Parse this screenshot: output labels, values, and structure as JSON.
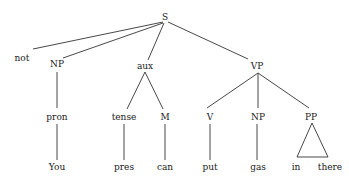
{
  "diagram": {
    "type": "syntax-tree",
    "line_color": "#333333",
    "text_color": "#1a1a1a",
    "nodes": {
      "s": {
        "label": "S",
        "x": 165,
        "y": 17
      },
      "not": {
        "label": "not",
        "x": 22,
        "y": 58
      },
      "np1": {
        "label": "NP",
        "x": 57,
        "y": 64
      },
      "aux": {
        "label": "aux",
        "x": 145,
        "y": 66
      },
      "vp": {
        "label": "VP",
        "x": 257,
        "y": 66
      },
      "pron": {
        "label": "pron",
        "x": 57,
        "y": 117
      },
      "tense": {
        "label": "tense",
        "x": 124,
        "y": 117
      },
      "m": {
        "label": "M",
        "x": 165,
        "y": 117
      },
      "v": {
        "label": "V",
        "x": 210,
        "y": 117
      },
      "np2": {
        "label": "NP",
        "x": 258,
        "y": 117
      },
      "pp": {
        "label": "PP",
        "x": 311,
        "y": 117
      },
      "you": {
        "label": "You",
        "x": 57,
        "y": 167
      },
      "pres": {
        "label": "pres",
        "x": 124,
        "y": 167
      },
      "can": {
        "label": "can",
        "x": 165,
        "y": 167
      },
      "put": {
        "label": "put",
        "x": 210,
        "y": 167
      },
      "gas": {
        "label": "gas",
        "x": 258,
        "y": 167
      },
      "in": {
        "label": "in",
        "x": 296,
        "y": 167
      },
      "there": {
        "label": "there",
        "x": 330,
        "y": 167
      }
    },
    "edges": [
      [
        "s",
        "not"
      ],
      [
        "s",
        "np1"
      ],
      [
        "s",
        "aux"
      ],
      [
        "s",
        "vp"
      ],
      [
        "np1",
        "pron"
      ],
      [
        "pron",
        "you"
      ],
      [
        "aux",
        "tense"
      ],
      [
        "aux",
        "m"
      ],
      [
        "tense",
        "pres"
      ],
      [
        "m",
        "can"
      ],
      [
        "vp",
        "v"
      ],
      [
        "vp",
        "np2"
      ],
      [
        "vp",
        "pp"
      ],
      [
        "v",
        "put"
      ],
      [
        "np2",
        "gas"
      ]
    ],
    "triangles": [
      {
        "parent": "pp",
        "children": [
          "in",
          "there"
        ]
      }
    ]
  }
}
